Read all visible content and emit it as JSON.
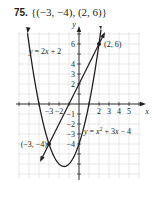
{
  "problem": {
    "number": "75.",
    "answer": "{(−3, −4), (2, 6)}"
  },
  "chart_data": {
    "type": "line",
    "title": "{(−3, −4), (2, 6)}",
    "xlabel": "x",
    "ylabel": "y",
    "xlim": [
      -6,
      6
    ],
    "ylim": [
      -7,
      7
    ],
    "grid": true,
    "x_tick_labels": [
      "-3",
      "-2",
      "2",
      "3",
      "4",
      "5"
    ],
    "y_tick_labels": [
      "6",
      "4",
      "3",
      "2",
      "-1",
      "-2",
      "-3",
      "-4"
    ],
    "series": [
      {
        "name": "y = 2x + 2",
        "kind": "line",
        "equation": "y = 2x + 2",
        "x": [
          -4.7,
          -3,
          0,
          2,
          2.6
        ],
        "y": [
          -7.4,
          -4,
          2,
          6,
          7.2
        ]
      },
      {
        "name": "y = x^2 + 3x - 4",
        "kind": "parabola",
        "equation": "y = x² + 3x − 4",
        "x": [
          -5.7,
          -5,
          -4,
          -3,
          -2,
          -1.5,
          -1,
          0,
          1,
          2,
          2.6
        ],
        "y": [
          11.4,
          6,
          0,
          -4,
          -6,
          -6.25,
          -6,
          -4,
          0,
          6,
          10.6
        ]
      }
    ],
    "annotations": [
      {
        "text": "(2, 6)",
        "x": 2,
        "y": 6
      },
      {
        "text": "(−3, −4)",
        "x": -3,
        "y": -4
      },
      {
        "text": "y = 2x + 2",
        "anchor": "upper-left"
      },
      {
        "text": "y = x² + 3x − 4",
        "anchor": "right"
      }
    ],
    "points": [
      {
        "x": -3,
        "y": -4
      },
      {
        "x": 2,
        "y": 6
      }
    ]
  }
}
